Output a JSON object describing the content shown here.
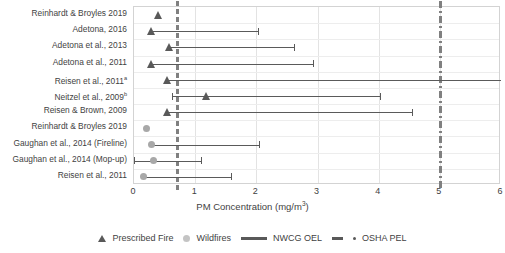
{
  "chart_data": {
    "type": "scatter",
    "title": "",
    "xlabel": "PM Concentration (mg/m3)",
    "xlabel_base": "PM Concentration (mg/m",
    "xlabel_sup": "3",
    "xlabel_tail": ")",
    "ylabel": "",
    "xlim": [
      0,
      6
    ],
    "xticks": [
      0,
      1,
      2,
      3,
      4,
      5,
      6
    ],
    "xtick_labels": [
      "0",
      "1",
      "2",
      "3",
      "4",
      "5",
      "6"
    ],
    "grid": true,
    "legend_position": "bottom",
    "reference_lines": [
      {
        "name": "NWCG OEL",
        "value": 0.7,
        "style": "dashed",
        "color": "#808080"
      },
      {
        "name": "OSHA PEL",
        "value": 5.0,
        "style": "dash-dot",
        "color": "#808080"
      }
    ],
    "categories": [
      "Reinhardt & Broyles 2019",
      "Adetona, 2016",
      "Adetona et al., 2013",
      "Adetona et al., 2011",
      "Reisen et al., 2011a",
      "Neitzel et al., 2009b",
      "Reisen & Brown, 2009",
      "Reinhardt & Broyles 2019",
      "Gaughan et al., 2014 (Fireline)",
      "Gaughan et al., 2014 (Mop-up)",
      "Reisen et al., 2011"
    ],
    "rows": [
      {
        "label": "Reinhardt & Broyles 2019",
        "sup": "",
        "group": "Prescribed Fire",
        "value": 0.4,
        "low": null,
        "high": null,
        "marker": "triangle"
      },
      {
        "label": "Adetona, 2016",
        "sup": "",
        "group": "Prescribed Fire",
        "value": 0.28,
        "low": 0.28,
        "high": 2.02,
        "marker": "triangle"
      },
      {
        "label": "Adetona et al., 2013",
        "sup": "",
        "group": "Prescribed Fire",
        "value": 0.58,
        "low": 0.58,
        "high": 2.62,
        "marker": "triangle"
      },
      {
        "label": "Adetona et al., 2011",
        "sup": "",
        "group": "Prescribed Fire",
        "value": 0.28,
        "low": 0.28,
        "high": 2.92,
        "marker": "triangle"
      },
      {
        "label": "Reisen et al., 2011",
        "sup": "a",
        "group": "Prescribed Fire",
        "value": 0.55,
        "low": 0.55,
        "high": 6.0,
        "marker": "triangle"
      },
      {
        "label": "Neitzel et al., 2009",
        "sup": "b",
        "group": "Prescribed Fire",
        "value": 1.18,
        "low": 0.62,
        "high": 4.02,
        "marker": "triangle"
      },
      {
        "label": "Reisen & Brown, 2009",
        "sup": "",
        "group": "Prescribed Fire",
        "value": 0.55,
        "low": 0.55,
        "high": 4.55,
        "marker": "triangle"
      },
      {
        "label": "Reinhardt & Broyles 2019",
        "sup": "",
        "group": "Wildfires",
        "value": 0.2,
        "low": null,
        "high": null,
        "marker": "circle"
      },
      {
        "label": "Gaughan et al., 2014 (Fireline)",
        "sup": "",
        "group": "Wildfires",
        "value": 0.28,
        "low": 0.28,
        "high": 2.05,
        "marker": "circle"
      },
      {
        "label": "Gaughan et al., 2014 (Mop-up)",
        "sup": "",
        "group": "Wildfires",
        "value": 0.32,
        "low": 0.0,
        "high": 1.1,
        "marker": "circle"
      },
      {
        "label": "Reisen et al., 2011",
        "sup": "",
        "group": "Wildfires",
        "value": 0.15,
        "low": 0.15,
        "high": 1.58,
        "marker": "circle"
      }
    ],
    "legend": [
      {
        "key": "prescribed-fire",
        "label": "Prescribed Fire",
        "symbol": "triangle",
        "color": "#595959"
      },
      {
        "key": "wildfires",
        "label": "Wildfires",
        "symbol": "circle",
        "color": "#c4c4c4"
      },
      {
        "key": "nwcg-oel",
        "label": "NWCG OEL",
        "symbol": "solid-line",
        "color": "#595959"
      },
      {
        "key": "osha-pel",
        "label": "OSHA PEL",
        "symbol": "dash-dot-line",
        "color": "#595959"
      }
    ]
  }
}
